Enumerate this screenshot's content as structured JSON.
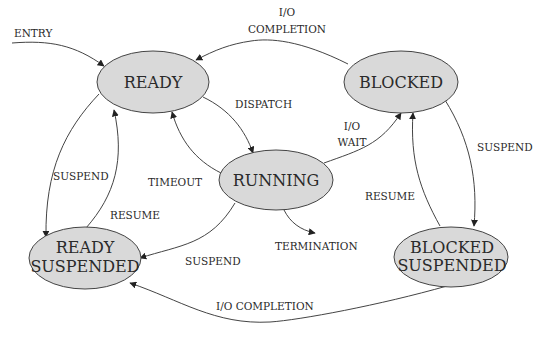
{
  "diagram": {
    "colors": {
      "node_fill": "#d9d9d9",
      "stroke": "#444444",
      "text": "#2a2a2a",
      "background": "#ffffff"
    },
    "nodes": {
      "ready": {
        "label": "READY"
      },
      "blocked": {
        "label": "BLOCKED"
      },
      "running": {
        "label": "RUNNING"
      },
      "ready_suspended": {
        "line1": "READY",
        "line2": "SUSPENDED"
      },
      "blocked_suspended": {
        "line1": "BLOCKED",
        "line2": "SUSPENDED"
      }
    },
    "edges": {
      "entry": {
        "label": "ENTRY",
        "from": "",
        "to": "ready"
      },
      "io_completion_top": {
        "line1": "I/O",
        "line2": "COMPLETION",
        "from": "blocked",
        "to": "ready"
      },
      "dispatch": {
        "label": "DISPATCH",
        "from": "ready",
        "to": "running"
      },
      "timeout": {
        "label": "TIMEOUT",
        "from": "running",
        "to": "ready"
      },
      "io_wait": {
        "line1": "I/O",
        "line2": "WAIT",
        "from": "running",
        "to": "blocked"
      },
      "suspend_ready": {
        "label": "SUSPEND",
        "from": "ready",
        "to": "ready_suspended"
      },
      "resume_ready": {
        "label": "RESUME",
        "from": "ready_suspended",
        "to": "ready"
      },
      "suspend_running": {
        "label": "SUSPEND",
        "from": "running",
        "to": "ready_suspended"
      },
      "termination": {
        "label": "TERMINATION",
        "from": "running",
        "to": ""
      },
      "suspend_blocked": {
        "label": "SUSPEND",
        "from": "blocked",
        "to": "blocked_suspended"
      },
      "resume_blocked": {
        "label": "RESUME",
        "from": "blocked_suspended",
        "to": "blocked"
      },
      "io_completion_bottom": {
        "label": "I/O COMPLETION",
        "from": "blocked_suspended",
        "to": "ready_suspended"
      }
    }
  }
}
